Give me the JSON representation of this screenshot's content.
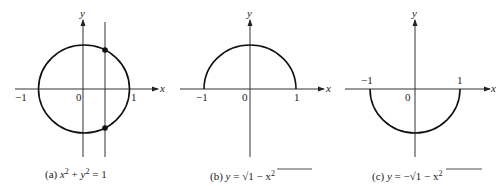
{
  "figure": {
    "panels": [
      {
        "id": "a",
        "caption_prefix": "(a)",
        "equation": "x² + y² = 1",
        "curve": "full-circle",
        "axis_x_label": "x",
        "axis_y_label": "y",
        "ticks": {
          "left": "−1",
          "origin": "0",
          "right": "1"
        },
        "vertical_line_test": true,
        "intersection_points": 2
      },
      {
        "id": "b",
        "caption_prefix": "(b)",
        "equation": "y = √(1 − x²)",
        "curve": "upper-semicircle",
        "axis_x_label": "x",
        "axis_y_label": "y",
        "ticks": {
          "left": "−1",
          "origin": "0",
          "right": "1"
        }
      },
      {
        "id": "c",
        "caption_prefix": "(c)",
        "equation": "y = −√(1 − x²)",
        "curve": "lower-semicircle",
        "axis_x_label": "x",
        "axis_y_label": "y",
        "ticks": {
          "left": "−1",
          "origin": "0",
          "right": "1"
        }
      }
    ]
  },
  "captions": {
    "a": {
      "prefix": "(a)",
      "lhs1": "x",
      "exp1": "2",
      "plus": " + ",
      "lhs2": "y",
      "exp2": "2",
      "rhs": " = 1"
    },
    "b": {
      "prefix": "(b)",
      "lhs": "y",
      "eq": " = ",
      "radical": "√",
      "radicand": "1 − x",
      "exp": "2"
    },
    "c": {
      "prefix": "(c)",
      "lhs": "y",
      "eq": " = −",
      "radical": "√",
      "radicand": "1 − x",
      "exp": "2"
    }
  },
  "labels": {
    "x": "x",
    "y": "y",
    "neg_one": "−1",
    "zero": "0",
    "one": "1"
  }
}
